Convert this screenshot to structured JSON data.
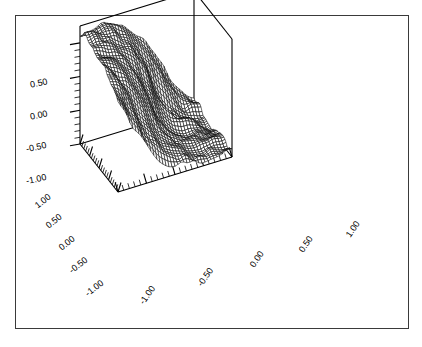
{
  "figure": {
    "background_color": "#ffffff",
    "frame_color": "#3a3a3a",
    "ink_color": "#000000"
  },
  "chart_data": {
    "type": "surface",
    "title": "",
    "xlabel": "",
    "ylabel": "",
    "zlabel": "",
    "style": "wireframe-mesh",
    "projection": "3d-axonometric",
    "grid": false,
    "legend": false,
    "xlim": [
      -1.0,
      1.0
    ],
    "ylim": [
      -1.0,
      1.0
    ],
    "zlim": [
      -1.0,
      0.75
    ],
    "x_ticks": [
      "-1.00",
      "-0.50",
      "0.00",
      "0.50",
      "1.00"
    ],
    "x_tick_values": [
      -1.0,
      -0.5,
      0.0,
      0.5,
      1.0
    ],
    "y_ticks": [
      "1.00",
      "0.50",
      "0.00",
      "-0.50",
      "-1.00"
    ],
    "y_tick_values": [
      1.0,
      0.5,
      0.0,
      -0.5,
      -1.0
    ],
    "z_ticks": [
      "0.50",
      "0.00",
      "-0.50",
      "-1.00"
    ],
    "z_tick_values": [
      0.5,
      0.0,
      -0.5,
      -1.0
    ],
    "minor_ticks_per_major": 5,
    "mesh_resolution": {
      "nx": 38,
      "ny": 38
    },
    "surface_description": "Smooth noisy sigmoid ridge: high plateau near z=+0.6 over the far-left/back region, falling steeply across a diagonal front to a low plateau near z=-0.8 at the near-right region, with small random bumps superimposed.",
    "z_range_observed": [
      -0.9,
      0.7
    ]
  },
  "axes": {
    "z_axis": {
      "name": "vertical-axis",
      "labels": [
        {
          "text": "0.50",
          "x": 30,
          "y": 78,
          "rot": -12
        },
        {
          "text": "0.00",
          "x": 30,
          "y": 110,
          "rot": -12
        },
        {
          "text": "-0.50",
          "x": 26,
          "y": 142,
          "rot": -12
        },
        {
          "text": "-1.00",
          "x": 26,
          "y": 174,
          "rot": -12
        }
      ]
    },
    "y_axis": {
      "name": "left-depth-axis",
      "labels": [
        {
          "text": "1.00",
          "x": 34,
          "y": 196,
          "rot": -38
        },
        {
          "text": "0.50",
          "x": 45,
          "y": 216,
          "rot": -38
        },
        {
          "text": "0.00",
          "x": 58,
          "y": 238,
          "rot": -38
        },
        {
          "text": "-0.50",
          "x": 68,
          "y": 260,
          "rot": -38
        },
        {
          "text": "-1.00",
          "x": 84,
          "y": 283,
          "rot": -38
        }
      ]
    },
    "x_axis": {
      "name": "right-horizontal-axis",
      "labels": [
        {
          "text": "-1.00",
          "x": 137,
          "y": 290,
          "rot": -55
        },
        {
          "text": "-0.50",
          "x": 195,
          "y": 272,
          "rot": -55
        },
        {
          "text": "0.00",
          "x": 248,
          "y": 254,
          "rot": -55
        },
        {
          "text": "0.50",
          "x": 297,
          "y": 239,
          "rot": -55
        },
        {
          "text": "1.00",
          "x": 344,
          "y": 224,
          "rot": -55
        }
      ]
    }
  }
}
